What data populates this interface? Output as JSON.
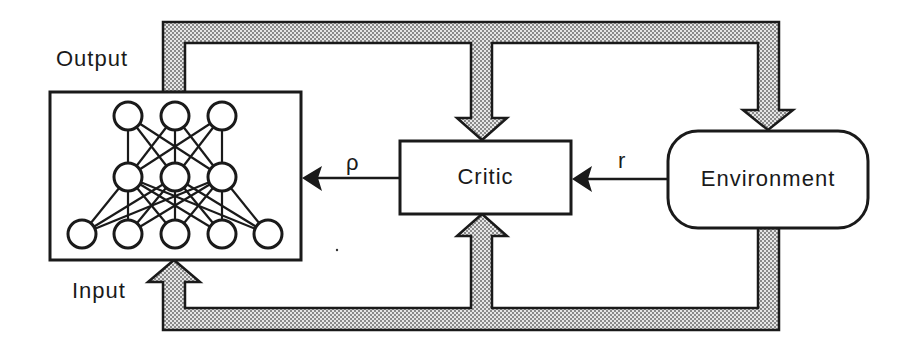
{
  "diagram": {
    "type": "reinforcement-learning-actor-critic-loop",
    "labels": {
      "output": "Output",
      "input": "Input",
      "rho": "ρ",
      "r": "r"
    },
    "nodes": {
      "network": {
        "label": "",
        "layers": [
          3,
          3,
          5
        ]
      },
      "critic": {
        "label": "Critic"
      },
      "environment": {
        "label": "Environment"
      }
    },
    "edges": [
      {
        "from": "network-output",
        "to": "critic",
        "style": "wide-hatched"
      },
      {
        "from": "network-output",
        "to": "environment",
        "style": "wide-hatched"
      },
      {
        "from": "environment",
        "to": "critic",
        "style": "wide-hatched"
      },
      {
        "from": "environment",
        "to": "network-input",
        "style": "wide-hatched"
      },
      {
        "from": "environment",
        "to": "critic",
        "label": "r",
        "style": "thin-arrow"
      },
      {
        "from": "critic",
        "to": "network",
        "label": "ρ",
        "style": "thin-arrow"
      }
    ],
    "colors": {
      "stroke": "#1a1a1a",
      "pipe_fill": "#bdbdbd",
      "background": "#ffffff"
    }
  }
}
